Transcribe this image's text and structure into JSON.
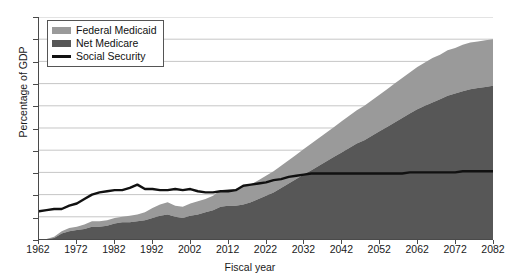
{
  "chart_data": {
    "type": "area",
    "title": "",
    "xlabel": "Fiscal year",
    "ylabel": "Percentage of GDP",
    "xlim": [
      1962,
      2082
    ],
    "ylim": [
      0,
      20
    ],
    "ytick_step": 2,
    "xtick_step": 10,
    "grid": true,
    "gridlines": "horizontal",
    "legend_position": "top-left",
    "stacked": true,
    "xticks": [
      1962,
      1972,
      1982,
      1992,
      2002,
      2012,
      2022,
      2032,
      2042,
      2052,
      2062,
      2072,
      2082
    ],
    "yticks": [
      0,
      2,
      4,
      6,
      8,
      10,
      12,
      14,
      16,
      18,
      20
    ],
    "colors": {
      "federal_medicaid": "#9a9a9a",
      "net_medicare": "#575757",
      "social_security": "#111111",
      "axis": "#4a4a4a",
      "gridline": "#bfbfbf",
      "background": "#ffffff"
    },
    "x": [
      1962,
      1964,
      1966,
      1968,
      1970,
      1972,
      1974,
      1976,
      1978,
      1980,
      1982,
      1984,
      1986,
      1988,
      1990,
      1992,
      1994,
      1996,
      1998,
      2000,
      2002,
      2004,
      2006,
      2008,
      2010,
      2012,
      2014,
      2016,
      2018,
      2020,
      2022,
      2024,
      2026,
      2028,
      2030,
      2032,
      2034,
      2036,
      2038,
      2040,
      2042,
      2044,
      2046,
      2048,
      2050,
      2052,
      2054,
      2056,
      2058,
      2060,
      2062,
      2064,
      2066,
      2068,
      2070,
      2072,
      2074,
      2076,
      2078,
      2080,
      2082
    ],
    "series": [
      {
        "name": "Net Medicare",
        "stack_order": 1,
        "color": "#575757",
        "values": [
          0.0,
          0.0,
          0.1,
          0.5,
          0.7,
          0.8,
          0.9,
          1.1,
          1.1,
          1.2,
          1.4,
          1.5,
          1.5,
          1.6,
          1.7,
          1.9,
          2.1,
          2.2,
          2.0,
          1.9,
          2.1,
          2.2,
          2.4,
          2.6,
          2.9,
          3.0,
          3.0,
          3.1,
          3.3,
          3.6,
          3.9,
          4.2,
          4.6,
          5.0,
          5.4,
          5.8,
          6.2,
          6.6,
          7.0,
          7.4,
          7.8,
          8.2,
          8.6,
          8.9,
          9.3,
          9.7,
          10.1,
          10.5,
          10.9,
          11.3,
          11.7,
          12.0,
          12.3,
          12.6,
          12.9,
          13.1,
          13.3,
          13.5,
          13.6,
          13.7,
          13.8
        ]
      },
      {
        "name": "Federal Medicaid",
        "stack_order": 2,
        "color": "#9a9a9a",
        "values": [
          0.0,
          0.0,
          0.1,
          0.2,
          0.3,
          0.3,
          0.4,
          0.5,
          0.5,
          0.5,
          0.5,
          0.5,
          0.6,
          0.6,
          0.7,
          0.9,
          1.0,
          1.1,
          1.0,
          1.0,
          1.1,
          1.2,
          1.2,
          1.3,
          1.5,
          1.5,
          1.5,
          1.6,
          1.6,
          1.7,
          1.8,
          1.9,
          2.0,
          2.1,
          2.2,
          2.3,
          2.4,
          2.5,
          2.6,
          2.7,
          2.8,
          2.9,
          3.0,
          3.1,
          3.2,
          3.3,
          3.4,
          3.5,
          3.6,
          3.7,
          3.8,
          3.9,
          4.0,
          4.0,
          4.1,
          4.1,
          4.2,
          4.2,
          4.2,
          4.2,
          4.2
        ]
      },
      {
        "name": "Social Security",
        "type": "line",
        "color": "#111111",
        "values": [
          2.5,
          2.6,
          2.7,
          2.7,
          3.0,
          3.2,
          3.6,
          4.0,
          4.2,
          4.3,
          4.4,
          4.4,
          4.6,
          4.9,
          4.5,
          4.5,
          4.4,
          4.4,
          4.5,
          4.4,
          4.5,
          4.3,
          4.2,
          4.2,
          4.3,
          4.3,
          4.4,
          4.8,
          4.9,
          5.0,
          5.1,
          5.3,
          5.4,
          5.6,
          5.7,
          5.8,
          5.9,
          5.9,
          5.9,
          5.9,
          5.9,
          5.9,
          5.9,
          5.9,
          5.9,
          5.9,
          5.9,
          5.9,
          5.9,
          6.0,
          6.0,
          6.0,
          6.0,
          6.0,
          6.0,
          6.0,
          6.1,
          6.1,
          6.1,
          6.1,
          6.1
        ]
      }
    ],
    "legend": [
      {
        "label": "Federal Medicaid",
        "icon": "area-swatch",
        "color": "#9a9a9a"
      },
      {
        "label": "Net Medicare",
        "icon": "area-swatch",
        "color": "#575757"
      },
      {
        "label": "Social Security",
        "icon": "line-swatch",
        "color": "#111111"
      }
    ]
  }
}
